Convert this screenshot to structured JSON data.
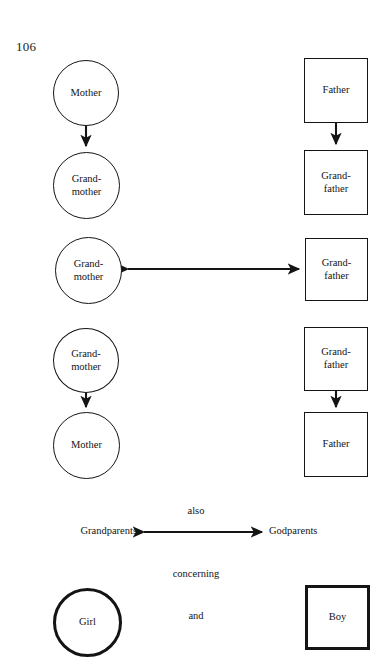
{
  "page": {
    "number": "106",
    "width": 389,
    "height": 672,
    "background": "#ffffff",
    "ink_color": "#141414"
  },
  "nodes": [
    {
      "id": "mother-top",
      "label": "Mother",
      "shape": "circle",
      "stroke": "thin",
      "x": 53,
      "y": 60,
      "w": 66,
      "h": 66
    },
    {
      "id": "grandmother-2",
      "label": "Grand-\nmother",
      "shape": "circle",
      "stroke": "thin",
      "x": 53,
      "y": 152,
      "w": 67,
      "h": 67
    },
    {
      "id": "grandmother-3",
      "label": "Grand-\nmother",
      "shape": "circle",
      "stroke": "thin",
      "x": 55,
      "y": 237,
      "w": 67,
      "h": 67
    },
    {
      "id": "grandmother-4",
      "label": "Grand-\nmother",
      "shape": "circle",
      "stroke": "thin",
      "x": 53,
      "y": 328,
      "w": 66,
      "h": 65
    },
    {
      "id": "mother-bottom",
      "label": "Mother",
      "shape": "circle",
      "stroke": "thin",
      "x": 53,
      "y": 412,
      "w": 67,
      "h": 67
    },
    {
      "id": "father-top",
      "label": "Father",
      "shape": "square",
      "stroke": "thin",
      "x": 304,
      "y": 58,
      "w": 64,
      "h": 65
    },
    {
      "id": "grandfather-2",
      "label": "Grand-\nfather",
      "shape": "square",
      "stroke": "thin",
      "x": 304,
      "y": 150,
      "w": 64,
      "h": 65
    },
    {
      "id": "grandfather-3",
      "label": "Grand-\nfather",
      "shape": "square",
      "stroke": "thin",
      "x": 305,
      "y": 238,
      "w": 63,
      "h": 63
    },
    {
      "id": "grandfather-4",
      "label": "Grand-\nfather",
      "shape": "square",
      "stroke": "thin",
      "x": 304,
      "y": 327,
      "w": 64,
      "h": 64
    },
    {
      "id": "father-bottom",
      "label": "Father",
      "shape": "square",
      "stroke": "thin",
      "x": 304,
      "y": 412,
      "w": 64,
      "h": 65
    },
    {
      "id": "girl",
      "label": "Girl",
      "shape": "circle",
      "stroke": "thick",
      "x": 53,
      "y": 588,
      "w": 69,
      "h": 69
    },
    {
      "id": "boy",
      "label": "Boy",
      "shape": "square",
      "stroke": "thick",
      "x": 305,
      "y": 585,
      "w": 65,
      "h": 65
    }
  ],
  "connectors": [
    {
      "id": "mother-to-grandmother",
      "kind": "arrow-down",
      "from": "mother-top",
      "to": "grandmother-2"
    },
    {
      "id": "grandmother-to-grandfather",
      "kind": "arrow-double",
      "from": "grandmother-3",
      "to": "grandfather-3"
    },
    {
      "id": "grandmother-to-mother",
      "kind": "arrow-down",
      "from": "grandmother-4",
      "to": "mother-bottom"
    },
    {
      "id": "father-to-grandfather",
      "kind": "arrow-down",
      "from": "father-top",
      "to": "grandfather-2"
    },
    {
      "id": "grandfather-to-father",
      "kind": "arrow-down",
      "from": "grandfather-4",
      "to": "father-bottom"
    },
    {
      "id": "grandparents-to-godparents",
      "kind": "arrow-double",
      "from": "grandparents-label",
      "to": "godparents-label"
    }
  ],
  "annotations": {
    "also": "also",
    "grandparents": "Grandparents",
    "godparents": "Godparents",
    "concerning": "concerning",
    "and": "and"
  }
}
